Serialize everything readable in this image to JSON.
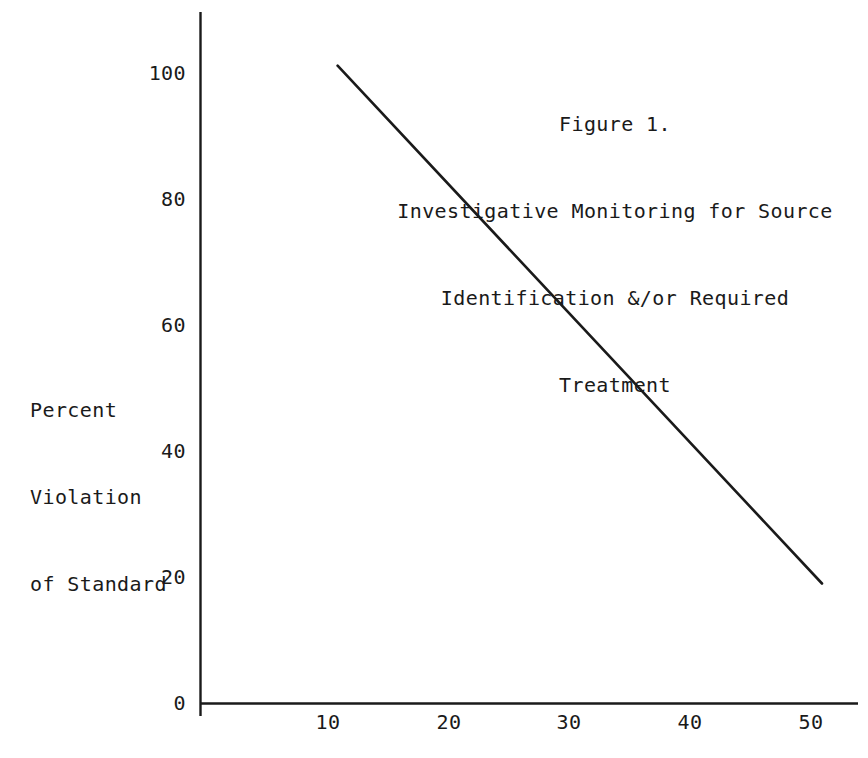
{
  "figure": {
    "background_color": "#ffffff",
    "ink_color": "#1a1a1a"
  },
  "title": {
    "line1": "Figure 1.",
    "line2": "Investigative Monitoring for Source",
    "line3": "Identification &/or Required",
    "line4": "Treatment"
  },
  "ylabel": {
    "line1": "Percent",
    "line2": "Violation",
    "line3": "of Standard"
  },
  "axis": {
    "y_ticks": [
      "0",
      "20",
      "40",
      "60",
      "80",
      "100"
    ],
    "x_ticks": [
      "10",
      "20",
      "30",
      "40",
      "50"
    ]
  },
  "chart_data": {
    "type": "line",
    "title": "Figure 1. Investigative Monitoring for Source Identification &/or Required Treatment",
    "xlabel": "",
    "ylabel": "Percent Violation of Standard",
    "xlim": [
      0,
      55
    ],
    "ylim": [
      0,
      104
    ],
    "grid": false,
    "legend": "none",
    "xticks": [
      10,
      20,
      30,
      40,
      50
    ],
    "xticklabels": [
      "10",
      "20",
      "30",
      "40",
      "50"
    ],
    "yticks": [
      0,
      20,
      40,
      60,
      80,
      100
    ],
    "yticklabels": [
      "0",
      "20",
      "40",
      "60",
      "80",
      "100"
    ],
    "series": [
      {
        "name": "Percent Violation of Standard",
        "color": "#1a1a1a",
        "linewidth": 2,
        "x": [
          10.8,
          51.0
        ],
        "y": [
          101.0,
          19.0
        ],
        "points": [
          {
            "x": 10.8,
            "y": 101.0
          },
          {
            "x": 51.0,
            "y": 19.0
          }
        ]
      }
    ]
  }
}
